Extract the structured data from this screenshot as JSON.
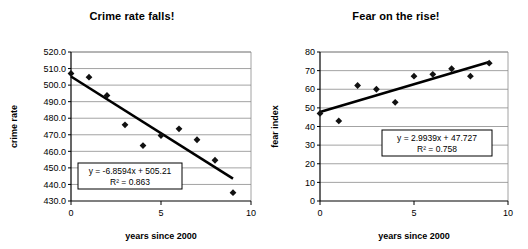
{
  "figure": {
    "background": "#ffffff",
    "panel_count": 2
  },
  "chart_data": [
    {
      "type": "scatter",
      "title": "Crime rate falls!",
      "xlabel": "years since 2000",
      "ylabel": "crime rate",
      "xlim": [
        0,
        10
      ],
      "ylim": [
        430,
        520
      ],
      "xticks": [
        "0",
        "5",
        "10"
      ],
      "xtick_values": [
        0,
        5,
        10
      ],
      "yticks": [
        "430.0",
        "440.0",
        "450.0",
        "460.0",
        "470.0",
        "480.0",
        "490.0",
        "500.0",
        "510.0",
        "520.0"
      ],
      "ytick_values": [
        430,
        440,
        450,
        460,
        470,
        480,
        490,
        500,
        510,
        520
      ],
      "grid": "horizontal",
      "legend": "none",
      "marker": "diamond",
      "marker_color": "#111111",
      "trendline_color": "#000000",
      "x": [
        0,
        1,
        2,
        3,
        4,
        5,
        6,
        7,
        8,
        9
      ],
      "values": [
        507.0,
        504.8,
        493.8,
        476.0,
        463.5,
        469.5,
        473.6,
        467.0,
        454.6,
        435.0
      ],
      "trendline": {
        "slope": -6.8594,
        "intercept": 505.21,
        "x_start": 0,
        "x_end": 9,
        "equation": "y = -6.8594x + 505.21",
        "r_squared": "R² = 0.863"
      }
    },
    {
      "type": "scatter",
      "title": "Fear on the rise!",
      "xlabel": "years since 2000",
      "ylabel": "fear index",
      "xlim": [
        0,
        10
      ],
      "ylim": [
        0,
        80
      ],
      "xticks": [
        "0",
        "5",
        "10"
      ],
      "xtick_values": [
        0,
        5,
        10
      ],
      "yticks": [
        "0",
        "10",
        "20",
        "30",
        "40",
        "50",
        "60",
        "70",
        "80"
      ],
      "ytick_values": [
        0,
        10,
        20,
        30,
        40,
        50,
        60,
        70,
        80
      ],
      "grid": "horizontal",
      "legend": "none",
      "marker": "diamond",
      "marker_color": "#111111",
      "trendline_color": "#000000",
      "x": [
        0,
        1,
        2,
        3,
        4,
        5,
        6,
        7,
        8,
        9
      ],
      "values": [
        47.0,
        43.0,
        62.0,
        60.0,
        53.0,
        67.0,
        68.0,
        71.0,
        67.0,
        74.0
      ],
      "trendline": {
        "slope": 2.9939,
        "intercept": 47.727,
        "x_start": 0,
        "x_end": 9,
        "equation": "y = 2.9939x + 47.727",
        "r_squared": "R² = 0.758"
      }
    }
  ]
}
